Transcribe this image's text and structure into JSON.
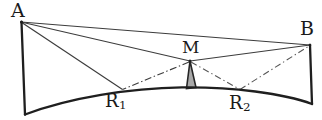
{
  "figure": {
    "kind": "geometry-diagram",
    "caption_text": "",
    "width": 322,
    "height": 120,
    "background_color": "#ffffff",
    "ink_color": "#1f1f1f",
    "thin_line_color": "#4a4a4a",
    "shaded_fill_color": "#a8a8a8"
  },
  "labels": {
    "a": "A",
    "b": "B",
    "m": "M",
    "r1_base": "R",
    "r1_sub": "1",
    "r2_base": "R",
    "r2_sub": "2"
  },
  "points": {
    "A": {
      "x": 21,
      "y": 22
    },
    "B": {
      "x": 310,
      "y": 45
    },
    "M": {
      "x": 190,
      "y": 61
    },
    "R1": {
      "x": 122,
      "y": 90
    },
    "R2": {
      "x": 240,
      "y": 90
    },
    "bottom_left": {
      "x": 25,
      "y": 115
    },
    "bottom_right": {
      "x": 312,
      "y": 104
    },
    "arc_apex": {
      "x": 182,
      "y": 87
    }
  },
  "edges": [
    {
      "name": "left-wall",
      "from": "A",
      "to": "bottom_left",
      "style": "solid",
      "weight": "thick"
    },
    {
      "name": "right-wall",
      "from": "B",
      "to": "bottom_right",
      "style": "solid",
      "weight": "thick"
    },
    {
      "name": "top-chord-AB",
      "from": "A",
      "to": "B",
      "style": "solid",
      "weight": "thin"
    },
    {
      "name": "ray-A-to-M",
      "from": "A",
      "to": "M",
      "style": "solid",
      "weight": "thin"
    },
    {
      "name": "ray-A-to-R1",
      "from": "A",
      "to": "R1",
      "style": "solid",
      "weight": "thin"
    },
    {
      "name": "ray-M-to-R1",
      "from": "M",
      "to": "R1",
      "style": "dash-dot",
      "weight": "thin"
    },
    {
      "name": "ray-M-to-B",
      "from": "M",
      "to": "B",
      "style": "solid",
      "weight": "thin"
    },
    {
      "name": "ray-M-to-R2",
      "from": "M",
      "to": "R2",
      "style": "dash-dot",
      "weight": "thin"
    },
    {
      "name": "ray-R2-to-B",
      "from": "R2",
      "to": "B",
      "style": "dash-dot",
      "weight": "thin"
    },
    {
      "name": "curved-base-arc",
      "from": "bottom_left",
      "to": "bottom_right",
      "style": "arc",
      "weight": "thick"
    }
  ],
  "shaded_region": {
    "name": "gray-spike-at-M",
    "apex": {
      "x": 190,
      "y": 61
    },
    "base_left": {
      "x": 186,
      "y": 88
    },
    "base_right": {
      "x": 196,
      "y": 87
    }
  }
}
